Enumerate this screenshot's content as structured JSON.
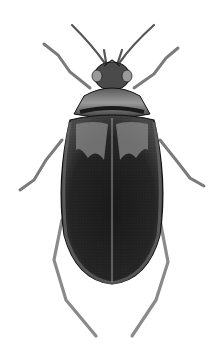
{
  "image": {
    "subject": "beetle illustration",
    "style": "engraved grayscale scientific illustration",
    "background": "#ffffff",
    "colors": {
      "elytra_dark": "#1c1c1c",
      "elytra_mid": "#3a3a3a",
      "elytra_light": "#8a8a8a",
      "pronotum": "#6e6e6e",
      "head": "#4a4a4a",
      "legs": "#8c8c8c",
      "outline": "#111111"
    }
  }
}
